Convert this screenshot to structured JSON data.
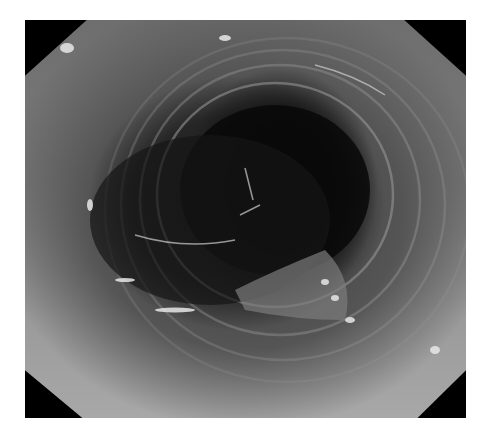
{
  "image": {
    "subject": "endoscopic view of tubular lumen with concentric mucosal rings",
    "color_mode": "grayscale",
    "frame_shape": "octagon",
    "colors": {
      "background": "#ffffff",
      "mask": "#000000",
      "lumen": "#0a0a0a",
      "wall_dark": "#3a3a3a",
      "wall_light": "#a8a8a8",
      "highlight": "#e8e8e8"
    }
  }
}
